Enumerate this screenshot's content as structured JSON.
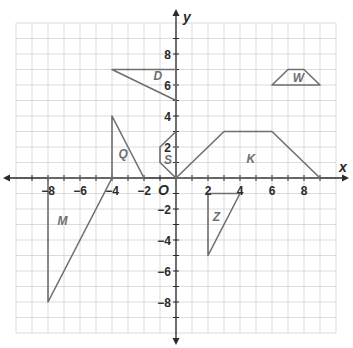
{
  "diagram": {
    "type": "coordinate-plane",
    "axes": {
      "x_label": "x",
      "y_label": "y",
      "origin_label": "O",
      "x_range": [
        -10,
        10
      ],
      "y_range": [
        -10,
        10
      ],
      "x_ticks": [
        {
          "value": -8,
          "label": "−8"
        },
        {
          "value": -6,
          "label": "−6"
        },
        {
          "value": -4,
          "label": "−4"
        },
        {
          "value": -2,
          "label": "−2"
        },
        {
          "value": 2,
          "label": "2"
        },
        {
          "value": 4,
          "label": "4"
        },
        {
          "value": 6,
          "label": "6"
        },
        {
          "value": 8,
          "label": "8"
        }
      ],
      "y_ticks": [
        {
          "value": 8,
          "label": "8"
        },
        {
          "value": 6,
          "label": "6"
        },
        {
          "value": 4,
          "label": "4"
        },
        {
          "value": 2,
          "label": "2"
        },
        {
          "value": -2,
          "label": "−2"
        },
        {
          "value": -4,
          "label": "−4"
        },
        {
          "value": -6,
          "label": "−6"
        },
        {
          "value": -8,
          "label": "−8"
        }
      ]
    },
    "colors": {
      "grid": "#d2d2d2",
      "axis": "#2a2a2a",
      "shape": "#6f6f6f"
    },
    "shapes": [
      {
        "label": "D",
        "vertices": [
          [
            -4,
            7
          ],
          [
            0,
            7
          ],
          [
            0,
            5
          ]
        ],
        "label_pos": [
          -1.4,
          6.3
        ]
      },
      {
        "label": "W",
        "vertices": [
          [
            6,
            6
          ],
          [
            7,
            7
          ],
          [
            8,
            7
          ],
          [
            9,
            6
          ]
        ],
        "label_pos": [
          7.3,
          6.2
        ]
      },
      {
        "label": "Q",
        "vertices": [
          [
            -4,
            4
          ],
          [
            -4,
            0
          ],
          [
            -2,
            0
          ]
        ],
        "label_pos": [
          -3.6,
          1.3
        ]
      },
      {
        "label": "S",
        "vertices": [
          [
            0,
            3
          ],
          [
            -1,
            2
          ],
          [
            -1,
            1
          ],
          [
            0,
            0
          ]
        ],
        "label_pos": [
          -0.75,
          0.9
        ]
      },
      {
        "label": "K",
        "vertices": [
          [
            0,
            0
          ],
          [
            3,
            3
          ],
          [
            6,
            3
          ],
          [
            9,
            0
          ]
        ],
        "label_pos": [
          4.4,
          1.0
        ]
      },
      {
        "label": "M",
        "vertices": [
          [
            -8,
            0
          ],
          [
            -8,
            -8
          ],
          [
            -4,
            0
          ]
        ],
        "label_pos": [
          -7.4,
          -3.0
        ]
      },
      {
        "label": "Z",
        "vertices": [
          [
            2,
            -1
          ],
          [
            4,
            -1
          ],
          [
            2,
            -5
          ]
        ],
        "label_pos": [
          2.3,
          -2.8
        ]
      }
    ]
  }
}
